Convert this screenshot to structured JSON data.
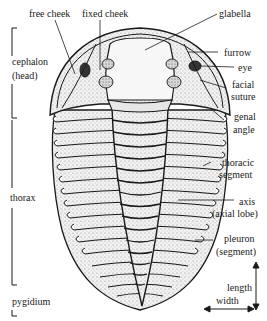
{
  "diagram": {
    "top_labels": {
      "free_cheek": "free cheek",
      "fixed_cheek": "fixed cheek",
      "glabella": "glabella"
    },
    "left_labels": {
      "cephalon_1": "cephalon",
      "cephalon_2": "(head)",
      "thorax": "thorax",
      "pygidium": "pygidium"
    },
    "right_labels": {
      "furrow": "furrow",
      "eye": "eye",
      "facial_1": "facial",
      "facial_2": "suture",
      "genal_1": "genal",
      "genal_2": "angle",
      "thoracic_1": "thoracic",
      "thoracic_2": "segment",
      "axis_1": "axis",
      "axis_2": "(axial lobe)",
      "pleuron_1": "pleuron",
      "pleuron_2": "(segment)",
      "length": "length",
      "width": "width"
    },
    "colors": {
      "ink": "#1a1a1a",
      "paper": "#ffffff",
      "stipple": "#888888"
    }
  }
}
